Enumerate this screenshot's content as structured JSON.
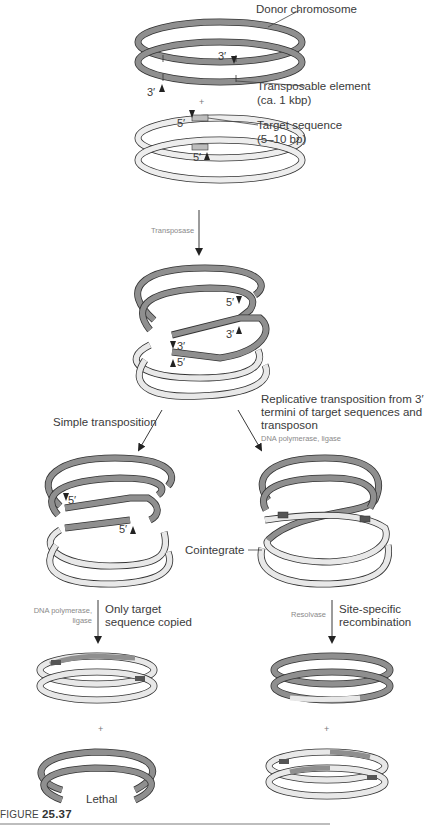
{
  "figure": {
    "caption_prefix": "FIGURE",
    "caption_number": "25.37"
  },
  "stage1": {
    "donor_label": "Donor chromosome",
    "te_label_line1": "Transposable element",
    "te_label_line2": "(ca. 1 kbp)",
    "donor_end_top": "3′",
    "donor_end_bottom": "3′",
    "plus": "+",
    "target_label_line1": "Target sequence",
    "target_label_line2": "(5–10 bp)",
    "target_end_top": "5′",
    "target_end_bottom": "5′"
  },
  "step1": {
    "enzyme": "Transposase"
  },
  "stage2": {
    "end_5_top": "5′",
    "end_3_right": "3′",
    "end_3_left": "3′",
    "end_5_left": "5′"
  },
  "branches": {
    "left_label": "Simple transposition",
    "right_label_line1": "Replicative transposition from 3′",
    "right_label_line2": "termini of target sequences and",
    "right_label_line3": "transposon",
    "right_enzyme": "DNA polymerase, ligase"
  },
  "stage3": {
    "left_end_5_top": "5′",
    "left_end_5_bottom": "5′",
    "cointegrate_label": "Cointegrate"
  },
  "step3": {
    "left_enzyme_line1": "DNA polymerase,",
    "left_enzyme_line2": "ligase",
    "left_label_line1": "Only target",
    "left_label_line2": "sequence copied",
    "right_enzyme": "Resolvase",
    "right_label_line1": "Site-specific",
    "right_label_line2": "recombination"
  },
  "stage4": {
    "plus_left": "+",
    "plus_right": "+",
    "lethal_label": "Lethal"
  },
  "colors": {
    "donor_strand": "#8f8f8f",
    "target_strand": "#d6d6d6",
    "transposon_dark": "#555555",
    "outline": "#333333"
  }
}
